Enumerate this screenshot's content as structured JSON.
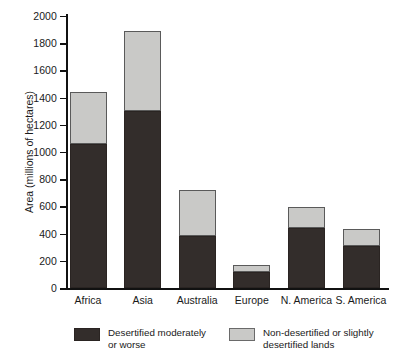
{
  "chart_data": {
    "type": "bar",
    "subtype": "stacked",
    "title": "",
    "xlabel": "",
    "ylabel": "Area (millions of hectares)",
    "ylim": [
      0,
      2000
    ],
    "ytick_step": 200,
    "yticks": [
      0,
      200,
      400,
      600,
      800,
      1000,
      1200,
      1400,
      1600,
      1800,
      2000
    ],
    "grid": false,
    "legend_position": "bottom",
    "categories": [
      "Africa",
      "Asia",
      "Australia",
      "Europe",
      "N. America",
      "S. America"
    ],
    "series": [
      {
        "name": "Desertified moderately or worse",
        "color": "#332d2b",
        "values": [
          1060,
          1300,
          380,
          120,
          440,
          310
        ]
      },
      {
        "name": "Non-desertified or slightly desertified lands",
        "color": "#c9c9c7",
        "values": [
          380,
          590,
          340,
          50,
          155,
          125
        ]
      }
    ],
    "totals": [
      1440,
      1890,
      720,
      170,
      595,
      435
    ]
  },
  "legend": {
    "items": [
      {
        "label": "Desertified moderately\nor worse",
        "swatch": "dark"
      },
      {
        "label": "Non-desertified or slightly\ndesertified lands",
        "swatch": "light"
      }
    ]
  },
  "colors": {
    "dark_fill": "#332d2b",
    "light_fill": "#c9c9c7",
    "axis": "#111111",
    "background": "#ffffff"
  }
}
